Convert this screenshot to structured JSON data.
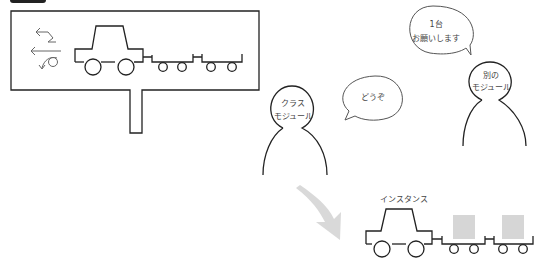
{
  "header": {
    "badge_label": "",
    "title": ""
  },
  "sign": {
    "icons": [
      "swap-arrows-icon",
      "left-arrow-icon",
      "rotate-arrow-icon"
    ]
  },
  "bubbles": {
    "request": {
      "line1": "1台",
      "line2": "お願いします"
    },
    "reply": {
      "text": "どうぞ"
    }
  },
  "characters": {
    "class_module": {
      "line1": "クラス",
      "line2": "モジュール"
    },
    "other_module": {
      "line1": "別の",
      "line2": "モジュール"
    }
  },
  "instance": {
    "label": "インスタンス"
  },
  "colors": {
    "stroke": "#222222",
    "cargo": "#d6d6d6",
    "arrow": "#d9d9d9"
  }
}
